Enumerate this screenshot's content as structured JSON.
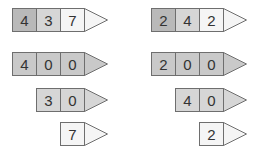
{
  "colors": {
    "hundreds": "#b9b9b9",
    "tens": "#d6d6d6",
    "ones": "#f5f5f5",
    "decomposed": "#c9c9c9",
    "border": "#6e6e6e"
  },
  "left": {
    "number": {
      "digits": [
        "4",
        "3",
        "7"
      ]
    },
    "hundreds": {
      "digits": [
        "4",
        "0",
        "0"
      ]
    },
    "tens": {
      "digits": [
        "3",
        "0"
      ]
    },
    "ones": {
      "digits": [
        "7"
      ]
    }
  },
  "right": {
    "number": {
      "digits": [
        "2",
        "4",
        "2"
      ]
    },
    "hundreds": {
      "digits": [
        "2",
        "0",
        "0"
      ]
    },
    "tens": {
      "digits": [
        "4",
        "0"
      ]
    },
    "ones": {
      "digits": [
        "2"
      ]
    }
  }
}
